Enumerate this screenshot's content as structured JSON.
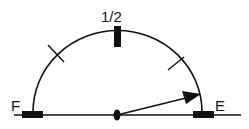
{
  "gauge": {
    "type": "fuel-gauge",
    "labels": {
      "full": "F",
      "half": "1/2",
      "empty": "E"
    },
    "needle_position": "near empty",
    "needle_angle_deg_from_right": 14,
    "colors": {
      "ink": "#111111",
      "background": "#ffffff"
    },
    "tick_marks": [
      {
        "position": "F",
        "style": "thick-bar"
      },
      {
        "position": "3/4",
        "style": "cross-tick"
      },
      {
        "position": "1/2",
        "style": "thick-bar"
      },
      {
        "position": "1/4",
        "style": "cross-tick"
      },
      {
        "position": "E",
        "style": "thick-bar"
      }
    ]
  }
}
